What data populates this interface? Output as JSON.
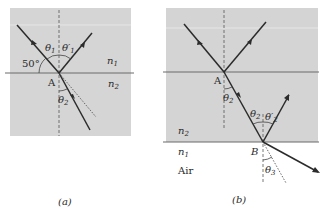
{
  "figure": {
    "panels": [
      {
        "id": "a",
        "caption": "(a)",
        "labels": {
          "theta1": "θ",
          "theta1_sub": "1",
          "theta1_prime": "θ′",
          "theta1_prime_sub": "1",
          "angle_50": "50°",
          "point_A": "A",
          "theta2": "θ",
          "theta2_sub": "2",
          "n1": "n",
          "n1_sub": "1",
          "n2": "n",
          "n2_sub": "2"
        }
      },
      {
        "id": "b",
        "caption": "(b)",
        "labels": {
          "point_A": "A",
          "theta2": "θ",
          "theta2_sub": "2",
          "theta2_b": "θ",
          "theta2_b_sub": "2",
          "theta2_prime": "θ′",
          "theta2_prime_sub": "2",
          "point_B": "B",
          "n2": "n",
          "n2_sub": "2",
          "n1": "n",
          "n1_sub": "1",
          "medium": "Air",
          "theta3": "θ",
          "theta3_sub": "3"
        }
      }
    ],
    "colors": {
      "medium_fill": "#d4d4d4",
      "upper_fill": "#dadada",
      "ray": "#2b2b2b",
      "interface": "#6a6a6a"
    }
  }
}
